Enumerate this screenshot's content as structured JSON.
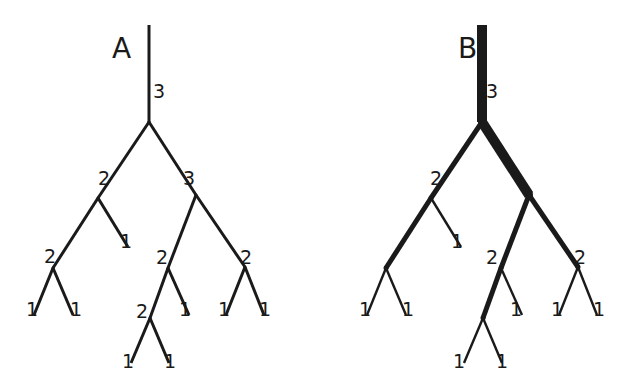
{
  "diagram": {
    "color": "#1a1a1a",
    "trees": [
      {
        "title": "A",
        "weighted": false,
        "nodes": [
          {
            "id": "r0",
            "parent": null
          },
          {
            "id": "n1",
            "parent": "r0",
            "label": "3"
          },
          {
            "id": "n2",
            "parent": "n1",
            "label": "2"
          },
          {
            "id": "n3",
            "parent": "n1",
            "label": "3"
          },
          {
            "id": "n4",
            "parent": "n2",
            "label": "2"
          },
          {
            "id": "n5",
            "parent": "n2",
            "label": "1"
          },
          {
            "id": "n6",
            "parent": "n4",
            "label": "1"
          },
          {
            "id": "n7",
            "parent": "n4",
            "label": "1"
          },
          {
            "id": "n8",
            "parent": "n3",
            "label": "2"
          },
          {
            "id": "n9",
            "parent": "n3",
            "label": "2"
          },
          {
            "id": "n10",
            "parent": "n8",
            "label": "2"
          },
          {
            "id": "n11",
            "parent": "n8",
            "label": "1"
          },
          {
            "id": "n12",
            "parent": "n10",
            "label": "1"
          },
          {
            "id": "n13",
            "parent": "n10",
            "label": "1"
          },
          {
            "id": "n14",
            "parent": "n9",
            "label": "1"
          },
          {
            "id": "n15",
            "parent": "n9",
            "label": "1"
          }
        ]
      },
      {
        "title": "B",
        "weighted": true,
        "nodes": [
          {
            "id": "r0",
            "parent": null
          },
          {
            "id": "n1",
            "parent": "r0",
            "label": "3"
          },
          {
            "id": "n2",
            "parent": "n1",
            "label": "2"
          },
          {
            "id": "n3",
            "parent": "n1",
            "label": ""
          },
          {
            "id": "n4",
            "parent": "n2",
            "label": ""
          },
          {
            "id": "n5",
            "parent": "n2",
            "label": "1"
          },
          {
            "id": "n6",
            "parent": "n4",
            "label": "1"
          },
          {
            "id": "n7",
            "parent": "n4",
            "label": "1"
          },
          {
            "id": "n8",
            "parent": "n3",
            "label": "2"
          },
          {
            "id": "n9",
            "parent": "n3",
            "label": "2"
          },
          {
            "id": "n10",
            "parent": "n8",
            "label": ""
          },
          {
            "id": "n11",
            "parent": "n8",
            "label": "1"
          },
          {
            "id": "n12",
            "parent": "n10",
            "label": "1"
          },
          {
            "id": "n13",
            "parent": "n10",
            "label": "1"
          },
          {
            "id": "n14",
            "parent": "n9",
            "label": "1"
          },
          {
            "id": "n15",
            "parent": "n9",
            "label": "1"
          }
        ],
        "weights": {
          "n1": 3,
          "n2": 2,
          "n3": 3,
          "n4": 2,
          "n5": 1,
          "n6": 1,
          "n7": 1,
          "n8": 2,
          "n9": 2,
          "n10": 2,
          "n11": 1,
          "n12": 1,
          "n13": 1,
          "n14": 1,
          "n15": 1
        }
      }
    ]
  }
}
